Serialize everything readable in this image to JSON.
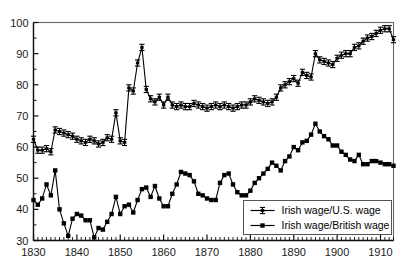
{
  "chart_data": {
    "type": "line",
    "title": "",
    "subtitle": "",
    "xlabel": "",
    "ylabel": "",
    "xlim": [
      1830,
      1913
    ],
    "ylim": [
      30,
      100
    ],
    "grid": false,
    "legend_position": "bottom-right",
    "x_ticks": [
      1830,
      1840,
      1850,
      1860,
      1870,
      1880,
      1890,
      1900,
      1910
    ],
    "x_tick_labels": [
      "1830",
      "1840",
      "1850",
      "1860",
      "1870",
      "1880",
      "1890",
      "1900",
      "1910"
    ],
    "x_minor_tick_step": 1,
    "y_ticks": [
      30,
      40,
      50,
      60,
      70,
      80,
      90,
      100
    ],
    "y_tick_labels": [
      "30",
      "40",
      "50",
      "60",
      "70",
      "80",
      "90",
      "100"
    ],
    "y_minor_tick_step": 5,
    "series": [
      {
        "name": "Irish wage/U.S. wage",
        "marker": "errorbar-cross",
        "color": "#000000",
        "x": [
          1830,
          1831,
          1832,
          1833,
          1834,
          1835,
          1836,
          1837,
          1838,
          1839,
          1840,
          1841,
          1842,
          1843,
          1844,
          1845,
          1846,
          1847,
          1848,
          1849,
          1850,
          1851,
          1852,
          1853,
          1854,
          1855,
          1856,
          1857,
          1858,
          1859,
          1860,
          1861,
          1862,
          1863,
          1864,
          1865,
          1866,
          1867,
          1868,
          1869,
          1870,
          1871,
          1872,
          1873,
          1874,
          1875,
          1876,
          1877,
          1878,
          1879,
          1880,
          1881,
          1882,
          1883,
          1884,
          1885,
          1886,
          1887,
          1888,
          1889,
          1890,
          1891,
          1892,
          1893,
          1894,
          1895,
          1896,
          1897,
          1898,
          1899,
          1900,
          1901,
          1902,
          1903,
          1904,
          1905,
          1906,
          1907,
          1908,
          1909,
          1910,
          1911,
          1912,
          1913
        ],
        "values": [
          62.5,
          59.0,
          59.0,
          59.5,
          58.5,
          65.5,
          65.0,
          64.5,
          64.0,
          63.5,
          62.5,
          62.0,
          61.5,
          62.5,
          62.0,
          61.0,
          61.5,
          63.0,
          62.5,
          71.0,
          62.0,
          61.5,
          79.0,
          78.0,
          87.0,
          92.0,
          78.5,
          75.5,
          74.5,
          76.0,
          73.5,
          76.0,
          73.5,
          73.0,
          73.5,
          73.0,
          73.0,
          74.0,
          73.5,
          73.0,
          72.5,
          73.0,
          73.5,
          73.0,
          73.5,
          73.0,
          72.5,
          73.0,
          73.5,
          73.5,
          74.5,
          75.5,
          75.0,
          74.5,
          74.0,
          74.5,
          76.0,
          79.0,
          80.0,
          81.0,
          82.0,
          80.5,
          84.0,
          83.0,
          82.5,
          90.0,
          88.0,
          87.5,
          87.0,
          86.5,
          88.5,
          89.5,
          90.0,
          90.0,
          92.0,
          92.5,
          94.0,
          95.0,
          95.5,
          96.5,
          97.5,
          98.0,
          98.0,
          94.5
        ]
      },
      {
        "name": "Irish wage/British wage",
        "marker": "square",
        "color": "#000000",
        "x": [
          1830,
          1831,
          1832,
          1833,
          1834,
          1835,
          1836,
          1837,
          1838,
          1839,
          1840,
          1841,
          1842,
          1843,
          1844,
          1845,
          1846,
          1847,
          1848,
          1849,
          1850,
          1851,
          1852,
          1853,
          1854,
          1855,
          1856,
          1857,
          1858,
          1859,
          1860,
          1861,
          1862,
          1863,
          1864,
          1865,
          1866,
          1867,
          1868,
          1869,
          1870,
          1871,
          1872,
          1873,
          1874,
          1875,
          1876,
          1877,
          1878,
          1879,
          1880,
          1881,
          1882,
          1883,
          1884,
          1885,
          1886,
          1887,
          1888,
          1889,
          1890,
          1891,
          1892,
          1893,
          1894,
          1895,
          1896,
          1897,
          1898,
          1899,
          1900,
          1901,
          1902,
          1903,
          1904,
          1905,
          1906,
          1907,
          1908,
          1909,
          1910,
          1911,
          1912,
          1913
        ],
        "values": [
          43.0,
          41.5,
          43.5,
          48.0,
          44.5,
          52.5,
          40.0,
          35.5,
          31.5,
          37.0,
          38.5,
          38.0,
          36.5,
          36.5,
          31.0,
          34.0,
          33.5,
          36.0,
          38.5,
          44.0,
          38.5,
          41.0,
          41.5,
          39.0,
          43.0,
          46.5,
          47.0,
          44.0,
          47.5,
          43.5,
          41.0,
          41.0,
          45.0,
          48.0,
          52.0,
          51.5,
          51.0,
          49.0,
          45.0,
          44.5,
          43.5,
          43.0,
          43.0,
          48.5,
          51.0,
          51.5,
          48.0,
          45.5,
          44.5,
          44.5,
          46.0,
          48.5,
          50.0,
          51.5,
          53.0,
          55.0,
          54.0,
          52.5,
          55.5,
          57.0,
          60.0,
          59.0,
          61.5,
          62.0,
          64.0,
          67.5,
          65.0,
          63.5,
          62.5,
          60.5,
          60.5,
          58.5,
          57.5,
          56.0,
          55.5,
          57.5,
          54.5,
          54.5,
          55.5,
          55.5,
          55.0,
          54.5,
          54.5,
          54.0
        ]
      }
    ]
  },
  "legend": {
    "entries": [
      {
        "label": "Irish wage/U.S. wage",
        "marker": "errorbar-cross"
      },
      {
        "label": "Irish wage/British wage",
        "marker": "square"
      }
    ]
  },
  "axes": {
    "y_min_label": "30",
    "y_max_label": "100",
    "x_min_label": "1830",
    "x_max_label": "1910"
  }
}
